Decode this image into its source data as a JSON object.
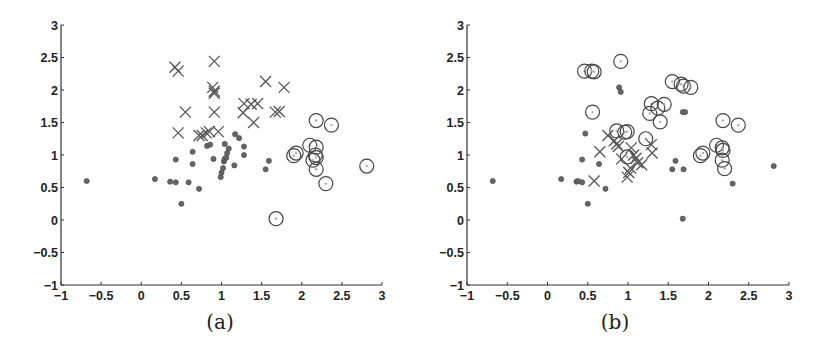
{
  "chart_data": [
    {
      "type": "scatter",
      "title": "",
      "caption": "(a)",
      "xlabel": "",
      "ylabel": "",
      "xlim": [
        -1,
        3
      ],
      "ylim": [
        -1,
        3
      ],
      "xticks": [
        -1,
        -0.5,
        0,
        0.5,
        1,
        1.5,
        2,
        2.5,
        3
      ],
      "yticks": [
        -1,
        -0.5,
        0,
        0.5,
        1,
        1.5,
        2,
        2.5,
        3
      ],
      "xtick_labels": [
        "−1",
        "−0.5",
        "0",
        "0.5",
        "1",
        "1.5",
        "2",
        "2.5",
        "3"
      ],
      "ytick_labels": [
        "−1",
        "−0.5",
        "0",
        "0.5",
        "1",
        "1.5",
        "2",
        "2.5",
        "3"
      ],
      "grid": false,
      "legend": null,
      "series": [
        {
          "name": "cross",
          "marker": "x",
          "points": [
            [
              0.42,
              2.35
            ],
            [
              0.46,
              2.29
            ],
            [
              0.91,
              2.44
            ],
            [
              0.89,
              2.04
            ],
            [
              0.91,
              1.98
            ],
            [
              0.91,
              1.95
            ],
            [
              1.55,
              2.13
            ],
            [
              1.78,
              2.04
            ],
            [
              0.55,
              1.66
            ],
            [
              0.91,
              1.66
            ],
            [
              1.28,
              1.79
            ],
            [
              1.37,
              1.78
            ],
            [
              1.45,
              1.79
            ],
            [
              1.27,
              1.65
            ],
            [
              1.4,
              1.5
            ],
            [
              1.67,
              1.66
            ],
            [
              1.72,
              1.67
            ],
            [
              0.46,
              1.34
            ],
            [
              0.72,
              1.3
            ],
            [
              0.81,
              1.34
            ],
            [
              0.85,
              1.36
            ],
            [
              0.96,
              1.36
            ],
            [
              0.76,
              1.3
            ]
          ]
        },
        {
          "name": "dot",
          "marker": "filled-circle",
          "points": [
            [
              -0.68,
              0.6
            ],
            [
              0.17,
              0.63
            ],
            [
              0.36,
              0.59
            ],
            [
              0.43,
              0.58
            ],
            [
              0.43,
              0.93
            ],
            [
              0.5,
              0.25
            ],
            [
              0.59,
              0.58
            ],
            [
              0.64,
              1.05
            ],
            [
              0.64,
              0.86
            ],
            [
              0.72,
              0.48
            ],
            [
              0.82,
              1.14
            ],
            [
              0.86,
              1.16
            ],
            [
              0.9,
              0.94
            ],
            [
              0.99,
              0.66
            ],
            [
              1.0,
              0.73
            ],
            [
              1.02,
              0.8
            ],
            [
              1.03,
              0.9
            ],
            [
              1.04,
              0.94
            ],
            [
              1.06,
              0.96
            ],
            [
              1.07,
              1.03
            ],
            [
              1.09,
              1.1
            ],
            [
              1.04,
              1.17
            ],
            [
              1.17,
              1.32
            ],
            [
              1.22,
              1.26
            ],
            [
              1.16,
              0.84
            ],
            [
              1.28,
              1.13
            ],
            [
              1.28,
              1.0
            ],
            [
              1.55,
              0.78
            ],
            [
              1.59,
              0.91
            ]
          ]
        },
        {
          "name": "circle",
          "marker": "open-circle",
          "points": [
            [
              2.18,
              1.53
            ],
            [
              2.37,
              1.46
            ],
            [
              1.93,
              1.03
            ],
            [
              1.9,
              0.99
            ],
            [
              2.1,
              1.15
            ],
            [
              2.18,
              1.12
            ],
            [
              2.17,
              1.0
            ],
            [
              2.18,
              0.96
            ],
            [
              2.14,
              0.92
            ],
            [
              2.18,
              0.78
            ],
            [
              2.3,
              0.56
            ],
            [
              2.81,
              0.83
            ],
            [
              1.68,
              0.02
            ]
          ]
        }
      ]
    },
    {
      "type": "scatter",
      "title": "",
      "caption": "(b)",
      "xlabel": "",
      "ylabel": "",
      "xlim": [
        -1,
        3
      ],
      "ylim": [
        -1,
        3
      ],
      "xticks": [
        -1,
        -0.5,
        0,
        0.5,
        1,
        1.5,
        2,
        2.5,
        3
      ],
      "yticks": [
        -1,
        -0.5,
        0,
        0.5,
        1,
        1.5,
        2,
        2.5,
        3
      ],
      "xtick_labels": [
        "−1",
        "−0.5",
        "0",
        "0.5",
        "1",
        "1.5",
        "2",
        "2.5",
        "3"
      ],
      "ytick_labels": [
        "−1",
        "−0.5",
        "0",
        "0.5",
        "1",
        "1.5",
        "2",
        "2.5",
        "3"
      ],
      "grid": false,
      "legend": null,
      "series": [
        {
          "name": "circle",
          "marker": "open-circle",
          "points": [
            [
              0.46,
              2.29
            ],
            [
              0.55,
              2.29
            ],
            [
              0.58,
              2.28
            ],
            [
              0.91,
              2.44
            ],
            [
              0.56,
              1.66
            ],
            [
              1.55,
              2.13
            ],
            [
              1.66,
              2.09
            ],
            [
              1.69,
              2.06
            ],
            [
              1.78,
              2.04
            ],
            [
              1.29,
              1.79
            ],
            [
              1.37,
              1.72
            ],
            [
              1.45,
              1.78
            ],
            [
              1.27,
              1.64
            ],
            [
              1.4,
              1.51
            ],
            [
              2.18,
              1.53
            ],
            [
              2.37,
              1.46
            ],
            [
              0.86,
              1.37
            ],
            [
              0.96,
              1.35
            ],
            [
              0.99,
              1.36
            ],
            [
              1.22,
              1.25
            ],
            [
              1.93,
              1.03
            ],
            [
              1.9,
              0.99
            ],
            [
              2.1,
              1.15
            ],
            [
              2.17,
              1.11
            ],
            [
              2.18,
              1.07
            ],
            [
              2.17,
              0.92
            ],
            [
              2.2,
              0.79
            ],
            [
              0.99,
              0.97
            ]
          ]
        },
        {
          "name": "cross",
          "marker": "x",
          "points": [
            [
              0.75,
              1.3
            ],
            [
              0.83,
              1.22
            ],
            [
              0.86,
              1.17
            ],
            [
              0.88,
              1.13
            ],
            [
              0.65,
              1.05
            ],
            [
              0.92,
              0.94
            ],
            [
              1.04,
              1.11
            ],
            [
              1.07,
              1.0
            ],
            [
              1.1,
              0.95
            ],
            [
              1.12,
              0.88
            ],
            [
              1.17,
              0.85
            ],
            [
              1.03,
              0.8
            ],
            [
              1.01,
              0.73
            ],
            [
              0.99,
              0.66
            ],
            [
              1.29,
              1.16
            ],
            [
              1.3,
              1.03
            ],
            [
              0.58,
              0.6
            ]
          ]
        },
        {
          "name": "dot",
          "marker": "filled-circle",
          "points": [
            [
              -0.68,
              0.6
            ],
            [
              0.17,
              0.63
            ],
            [
              0.36,
              0.59
            ],
            [
              0.38,
              0.6
            ],
            [
              0.43,
              0.58
            ],
            [
              0.43,
              0.93
            ],
            [
              0.47,
              1.33
            ],
            [
              0.5,
              0.25
            ],
            [
              0.64,
              0.86
            ],
            [
              0.72,
              0.48
            ],
            [
              0.89,
              2.04
            ],
            [
              0.91,
              1.97
            ],
            [
              1.68,
              1.66
            ],
            [
              1.71,
              1.66
            ],
            [
              1.55,
              0.78
            ],
            [
              1.59,
              0.91
            ],
            [
              1.69,
              0.78
            ],
            [
              1.68,
              0.02
            ],
            [
              2.3,
              0.56
            ],
            [
              2.81,
              0.83
            ]
          ]
        }
      ]
    }
  ]
}
